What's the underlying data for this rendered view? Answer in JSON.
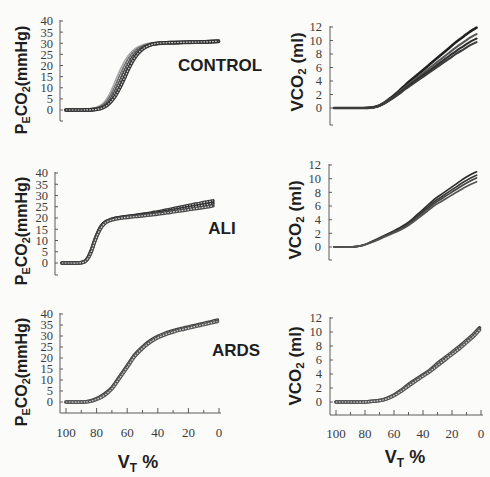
{
  "figure": {
    "groups": {
      "control": "CONTROL",
      "ali": "ALI",
      "ards": "ARDS"
    },
    "axis_titles": {
      "peco2": {
        "main1": "P",
        "sub1": "E",
        "main2": "CO",
        "sub2": "2",
        "unit": "(mmHg)"
      },
      "vco2": {
        "main": "VCO",
        "sub": "2",
        "unit": " (ml)"
      },
      "vt": {
        "main": "V",
        "sub": "T",
        "unit": " %"
      }
    }
  },
  "chart_data": [
    {
      "type": "line",
      "title": "CONTROL",
      "xlabel": "VT %",
      "ylabel": "PECO2(mmHg)",
      "xlim": [
        100,
        0
      ],
      "ylim": [
        0,
        40
      ],
      "yticks": [
        0,
        5,
        10,
        15,
        20,
        25,
        30,
        35,
        40
      ],
      "xticks": [],
      "xticks_minor": [],
      "series": [
        {
          "name": "curve 1",
          "color": "#a6a6a6",
          "x": [
            100,
            90,
            85,
            82,
            80,
            77,
            74,
            71,
            68,
            65,
            62,
            59,
            56,
            53,
            50,
            47,
            44,
            40,
            35,
            30,
            20,
            10,
            1
          ],
          "y": [
            0,
            0,
            0.1,
            0.4,
            0.8,
            1.8,
            3.8,
            7.2,
            11.8,
            16.8,
            21,
            24.2,
            26.5,
            27.9,
            28.8,
            29.4,
            29.8,
            30.1,
            30.2,
            30.3,
            30.5,
            30.7,
            31
          ]
        },
        {
          "name": "curve 2",
          "color": "#6e6e6e",
          "x": [
            100,
            90,
            85,
            82,
            80,
            77,
            74,
            71,
            68,
            65,
            62,
            59,
            56,
            53,
            50,
            47,
            44,
            40,
            35,
            30,
            20,
            10,
            1
          ],
          "y": [
            0,
            0,
            0.1,
            0.3,
            0.6,
            1.4,
            3,
            5.8,
            9.8,
            14.5,
            19,
            22.8,
            25.5,
            27.3,
            28.4,
            29.1,
            29.6,
            30,
            30.2,
            30.3,
            30.5,
            30.7,
            31.1
          ]
        },
        {
          "name": "curve 3",
          "color": "#4a4a4a",
          "x": [
            100,
            90,
            85,
            82,
            80,
            77,
            74,
            71,
            68,
            65,
            62,
            59,
            56,
            53,
            50,
            47,
            44,
            40,
            35,
            30,
            20,
            10,
            1
          ],
          "y": [
            0,
            0,
            0.05,
            0.2,
            0.4,
            1,
            2.2,
            4.5,
            8,
            12.3,
            16.8,
            21,
            24.2,
            26.5,
            28,
            28.9,
            29.5,
            29.9,
            30.1,
            30.2,
            30.4,
            30.6,
            30.8
          ]
        },
        {
          "name": "curve 4",
          "color": "#333333",
          "x": [
            100,
            90,
            85,
            82,
            80,
            77,
            74,
            71,
            68,
            65,
            62,
            59,
            56,
            53,
            50,
            47,
            44,
            40,
            35,
            30,
            20,
            10,
            1
          ],
          "y": [
            0,
            0,
            0.05,
            0.15,
            0.3,
            0.8,
            1.8,
            3.6,
            6.3,
            10,
            14.4,
            19,
            22.8,
            25.6,
            27.5,
            28.7,
            29.5,
            30,
            30.2,
            30.3,
            30.5,
            30.6,
            30.9
          ]
        }
      ]
    },
    {
      "type": "line",
      "title": "CONTROL",
      "xlabel": "VT %",
      "ylabel": "VCO2 (ml)",
      "xlim": [
        100,
        0
      ],
      "ylim": [
        0,
        12
      ],
      "yticks": [
        0,
        2,
        4,
        6,
        8,
        10,
        12
      ],
      "xticks": [],
      "xticks_minor": [],
      "series": [
        {
          "name": "curve 1",
          "color": "#1f1f1f",
          "x": [
            100,
            90,
            80,
            75,
            70,
            65,
            60,
            55,
            50,
            45,
            40,
            35,
            30,
            25,
            20,
            15,
            10,
            5,
            1
          ],
          "y": [
            0,
            0,
            0,
            0.05,
            0.25,
            0.8,
            1.6,
            2.5,
            3.5,
            4.4,
            5.3,
            6.2,
            7.1,
            8,
            8.9,
            9.8,
            10.6,
            11.4,
            11.9
          ]
        },
        {
          "name": "curve 2",
          "color": "#555555",
          "x": [
            100,
            90,
            80,
            75,
            70,
            65,
            60,
            55,
            50,
            45,
            40,
            35,
            30,
            25,
            20,
            15,
            10,
            5,
            1
          ],
          "y": [
            0,
            0,
            0,
            0.05,
            0.23,
            0.74,
            1.47,
            2.3,
            3.22,
            4.05,
            4.88,
            5.7,
            6.53,
            7.36,
            8.19,
            9.02,
            9.75,
            10.49,
            10.95
          ]
        },
        {
          "name": "curve 3",
          "color": "#2e2e2e",
          "x": [
            100,
            90,
            80,
            75,
            70,
            65,
            60,
            55,
            50,
            45,
            40,
            35,
            30,
            25,
            20,
            15,
            10,
            5,
            1
          ],
          "y": [
            0,
            0,
            0,
            0.04,
            0.22,
            0.69,
            1.38,
            2.16,
            3.03,
            3.81,
            4.58,
            5.36,
            6.14,
            6.92,
            7.7,
            8.48,
            9.17,
            9.86,
            10.29
          ]
        },
        {
          "name": "curve 4",
          "color": "#3c3c3c",
          "x": [
            100,
            90,
            80,
            75,
            70,
            65,
            60,
            55,
            50,
            45,
            40,
            35,
            30,
            25,
            20,
            15,
            10,
            5,
            1
          ],
          "y": [
            0,
            0,
            0,
            0.04,
            0.2,
            0.66,
            1.31,
            2.05,
            2.87,
            3.61,
            4.35,
            5.08,
            5.82,
            6.56,
            7.3,
            8.04,
            8.69,
            9.35,
            9.76
          ]
        }
      ]
    },
    {
      "type": "line",
      "title": "ALI",
      "xlabel": "VT %",
      "ylabel": "PECO2(mmHg)",
      "xlim": [
        100,
        0
      ],
      "ylim": [
        0,
        40
      ],
      "yticks": [
        0,
        5,
        10,
        15,
        20,
        25,
        30,
        35,
        40
      ],
      "xticks": [],
      "xticks_minor": [],
      "series": [
        {
          "name": "curve 1",
          "color": "#3a3a3a",
          "x": [
            100,
            95,
            90,
            87,
            85,
            83,
            81,
            79,
            77,
            75,
            73,
            71,
            68,
            64,
            60,
            55,
            50,
            45,
            40,
            35,
            30,
            25,
            20,
            15,
            10,
            5,
            2
          ],
          "y": [
            0,
            0,
            0,
            0.2,
            0.8,
            2.5,
            5.5,
            9.5,
            13,
            15.8,
            17.5,
            18.5,
            19.4,
            20,
            20.4,
            20.9,
            21.4,
            21.9,
            22.5,
            23.1,
            23.8,
            24.5,
            25.2,
            25.9,
            26.6,
            27.2,
            27.6
          ]
        },
        {
          "name": "curve 2",
          "color": "#2e2e2e",
          "x": [
            100,
            95,
            90,
            87,
            85,
            83,
            81,
            79,
            77,
            75,
            73,
            71,
            68,
            64,
            60,
            55,
            50,
            45,
            40,
            35,
            30,
            25,
            20,
            15,
            10,
            5,
            2
          ],
          "y": [
            0,
            0,
            0,
            0.2,
            0.8,
            2.5,
            5.5,
            9.5,
            13,
            15.8,
            17.5,
            18.5,
            19.4,
            20,
            20.4,
            20.8,
            21.2,
            21.6,
            22,
            22.5,
            23.1,
            23.7,
            24.3,
            24.9,
            25.5,
            26.1,
            26.5
          ]
        },
        {
          "name": "curve 3",
          "color": "#4a4a4a",
          "x": [
            100,
            95,
            90,
            87,
            85,
            83,
            81,
            79,
            77,
            75,
            73,
            71,
            68,
            64,
            60,
            55,
            50,
            45,
            40,
            35,
            30,
            25,
            20,
            15,
            10,
            5,
            2
          ],
          "y": [
            0,
            0,
            0,
            0.2,
            0.7,
            2.2,
            5,
            9,
            12.5,
            15.3,
            17.1,
            18.2,
            19.1,
            19.7,
            20.1,
            20.5,
            20.8,
            21.2,
            21.6,
            22,
            22.5,
            23,
            23.5,
            24,
            24.5,
            25,
            25.4
          ]
        }
      ]
    },
    {
      "type": "line",
      "title": "ALI",
      "xlabel": "VT %",
      "ylabel": "VCO2 (ml)",
      "xlim": [
        100,
        0
      ],
      "ylim": [
        0,
        12
      ],
      "yticks": [
        0,
        2,
        4,
        6,
        8,
        10,
        12
      ],
      "xticks": [],
      "xticks_minor": [],
      "series": [
        {
          "name": "curve 1",
          "color": "#2a2a2a",
          "x": [
            100,
            90,
            85,
            80,
            75,
            70,
            65,
            60,
            55,
            50,
            45,
            40,
            35,
            30,
            25,
            20,
            15,
            10,
            5,
            1
          ],
          "y": [
            0,
            0,
            0.05,
            0.26,
            0.68,
            1.16,
            1.68,
            2.2,
            2.73,
            3.36,
            4.2,
            5.15,
            6.09,
            7.04,
            7.77,
            8.5,
            9.24,
            9.98,
            10.6,
            11.0
          ]
        },
        {
          "name": "curve 2",
          "color": "#3a3a3a",
          "x": [
            100,
            90,
            85,
            80,
            75,
            70,
            65,
            60,
            55,
            50,
            45,
            40,
            35,
            30,
            25,
            20,
            15,
            10,
            5,
            1
          ],
          "y": [
            0,
            0,
            0.05,
            0.25,
            0.65,
            1.1,
            1.6,
            2.1,
            2.6,
            3.2,
            4,
            4.9,
            5.8,
            6.7,
            7.4,
            8.1,
            8.8,
            9.5,
            10.1,
            10.5
          ]
        },
        {
          "name": "curve 3",
          "color": "#444444",
          "x": [
            100,
            90,
            85,
            80,
            75,
            70,
            65,
            60,
            55,
            50,
            45,
            40,
            35,
            30,
            25,
            20,
            15,
            10,
            5,
            1
          ],
          "y": [
            0,
            0,
            0.05,
            0.24,
            0.62,
            1.06,
            1.54,
            2.02,
            2.5,
            3.07,
            3.84,
            4.7,
            5.57,
            6.43,
            7.1,
            7.78,
            8.45,
            9.12,
            9.7,
            10.1
          ]
        },
        {
          "name": "curve 4",
          "color": "#555555",
          "x": [
            100,
            90,
            85,
            80,
            75,
            70,
            65,
            60,
            55,
            50,
            45,
            40,
            35,
            30,
            25,
            20,
            15,
            10,
            5,
            1
          ],
          "y": [
            0,
            0,
            0.05,
            0.23,
            0.59,
            1,
            1.46,
            1.91,
            2.37,
            2.91,
            3.64,
            4.46,
            5.28,
            6.1,
            6.73,
            7.37,
            8.01,
            8.65,
            9.19,
            9.55
          ]
        }
      ]
    },
    {
      "type": "line",
      "title": "ARDS",
      "xlabel": "VT %",
      "ylabel": "PECO2(mmHg)",
      "xlim": [
        100,
        0
      ],
      "ylim": [
        0,
        40
      ],
      "yticks": [
        0,
        5,
        10,
        15,
        20,
        25,
        30,
        35,
        40
      ],
      "xticks": [
        100,
        80,
        60,
        40,
        20,
        0
      ],
      "xticks_minor": [
        90,
        70,
        50,
        30,
        10
      ],
      "series": [
        {
          "name": "curve 1",
          "color": "#444444",
          "x": [
            100,
            90,
            85,
            80,
            75,
            70,
            65,
            60,
            55,
            50,
            45,
            40,
            35,
            30,
            25,
            20,
            15,
            10,
            5,
            1
          ],
          "y": [
            0,
            0,
            0.3,
            1.5,
            3.5,
            6.5,
            11.5,
            16.5,
            21.5,
            25,
            27.8,
            29.8,
            31.3,
            32.4,
            33.3,
            34.1,
            34.9,
            35.7,
            36.5,
            37.2
          ]
        },
        {
          "name": "curve 2",
          "color": "#555555",
          "x": [
            100,
            90,
            85,
            80,
            75,
            70,
            65,
            60,
            55,
            50,
            45,
            40,
            35,
            30,
            25,
            20,
            15,
            10,
            5,
            1
          ],
          "y": [
            0,
            0,
            0.2,
            1.2,
            3,
            6,
            10.8,
            15.8,
            20.8,
            24.4,
            27.2,
            29.2,
            30.7,
            31.8,
            32.8,
            33.6,
            34.4,
            35.2,
            36,
            36.6
          ]
        }
      ]
    },
    {
      "type": "line",
      "title": "ARDS",
      "xlabel": "VT %",
      "ylabel": "VCO2 (ml)",
      "xlim": [
        100,
        0
      ],
      "ylim": [
        0,
        12
      ],
      "yticks": [
        0,
        2,
        4,
        6,
        8,
        10,
        12
      ],
      "xticks": [
        100,
        80,
        60,
        40,
        20,
        0
      ],
      "xticks_minor": [
        90,
        70,
        50,
        30,
        10
      ],
      "series": [
        {
          "name": "curve 1",
          "color": "#444444",
          "x": [
            100,
            90,
            80,
            75,
            70,
            65,
            60,
            55,
            50,
            45,
            40,
            35,
            30,
            25,
            20,
            15,
            10,
            5,
            1
          ],
          "y": [
            0,
            0,
            0,
            0.1,
            0.2,
            0.5,
            1,
            1.7,
            2.5,
            3.2,
            3.9,
            4.6,
            5.5,
            6.3,
            7.1,
            7.9,
            8.8,
            9.7,
            10.6
          ]
        },
        {
          "name": "curve 2",
          "color": "#555555",
          "x": [
            100,
            90,
            80,
            75,
            70,
            65,
            60,
            55,
            50,
            45,
            40,
            35,
            30,
            25,
            20,
            15,
            10,
            5,
            1
          ],
          "y": [
            0,
            0,
            0,
            0.1,
            0.2,
            0.45,
            0.9,
            1.55,
            2.3,
            3,
            3.7,
            4.4,
            5.2,
            6,
            6.8,
            7.6,
            8.5,
            9.4,
            10.3
          ]
        }
      ]
    }
  ]
}
